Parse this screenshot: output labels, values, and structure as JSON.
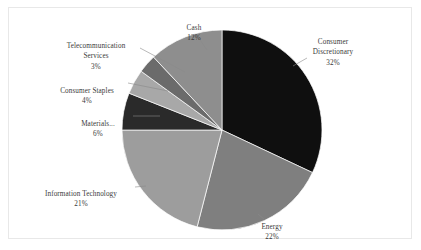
{
  "chart_data": {
    "type": "pie",
    "title": "",
    "subtitle": "",
    "xlabel": "",
    "ylabel": "",
    "legend_position": "none",
    "grid": false,
    "units": "percent",
    "total": 100,
    "start_angle_deg": 0,
    "direction": "clockwise",
    "categories": [
      "Consumer Discretionary",
      "Energy",
      "Information Technology",
      "Materials...",
      "Consumer Staples",
      "Telecommunication Services",
      "Cash"
    ],
    "values": [
      32,
      22,
      21,
      6,
      4,
      3,
      12
    ],
    "value_labels": [
      "32%",
      "22%",
      "21%",
      "6%",
      "4%",
      "3%",
      "12%"
    ],
    "colors": [
      "#0f0f0f",
      "#7f7f7f",
      "#9d9d9d",
      "#2a2a2a",
      "#a8a8a8",
      "#6b6b6b",
      "#8e8e8e"
    ],
    "slices": [
      {
        "name": "Consumer Discretionary",
        "label": "Consumer\nDiscretionary",
        "value": 32,
        "value_label": "32%",
        "color": "#0f0f0f"
      },
      {
        "name": "Energy",
        "label": "Energy",
        "value": 22,
        "value_label": "22%",
        "color": "#7f7f7f"
      },
      {
        "name": "Information Technology",
        "label": "Information Technology",
        "value": 21,
        "value_label": "21%",
        "color": "#9d9d9d"
      },
      {
        "name": "Materials",
        "label": "Materials...",
        "value": 6,
        "value_label": "6%",
        "color": "#2a2a2a"
      },
      {
        "name": "Consumer Staples",
        "label": "Consumer Staples",
        "value": 4,
        "value_label": "4%",
        "color": "#a8a8a8"
      },
      {
        "name": "Telecommunication Services",
        "label": "Telecommunication\nServices",
        "value": 3,
        "value_label": "3%",
        "color": "#6b6b6b"
      },
      {
        "name": "Cash",
        "label": "Cash",
        "value": 12,
        "value_label": "12%",
        "color": "#8e8e8e"
      }
    ]
  },
  "frame": {
    "border_color": "#e8e8e8",
    "background_color": "#ffffff"
  },
  "labels": {
    "consumer_discretionary": "Consumer\nDiscretionary",
    "consumer_discretionary_pct": "32%",
    "energy": "Energy",
    "energy_pct": "22%",
    "information_technology": "Information Technology",
    "information_technology_pct": "21%",
    "materials": "Materials...",
    "materials_pct": "6%",
    "consumer_staples": "Consumer Staples",
    "consumer_staples_pct": "4%",
    "telecommunication_services": "Telecommunication\nServices",
    "telecommunication_services_pct": "3%",
    "cash": "Cash",
    "cash_pct": "12%"
  }
}
